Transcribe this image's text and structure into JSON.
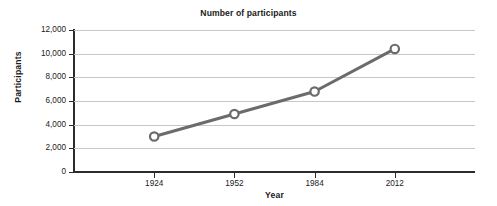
{
  "chart_data": {
    "type": "line",
    "title": "Number of participants",
    "xlabel": "Year",
    "ylabel": "Participants",
    "categories": [
      "1924",
      "1952",
      "1984",
      "2012"
    ],
    "values": [
      3000,
      4900,
      6800,
      10400
    ],
    "series": [
      {
        "name": "Participants",
        "values": [
          3000,
          4900,
          6800,
          10400
        ]
      }
    ],
    "ylim": [
      0,
      12000
    ],
    "ytick_labels": [
      "0",
      "2,000",
      "4,000",
      "6,000",
      "8,000",
      "10,000",
      "12,000"
    ],
    "ytick_values": [
      0,
      2000,
      4000,
      6000,
      8000,
      10000,
      12000
    ],
    "grid": true,
    "legend": false,
    "colors": {
      "line": "#6b6b6b",
      "marker_fill": "#ffffff",
      "marker_stroke": "#6b6b6b",
      "gridline": "#c8c8c8",
      "axis": "#2b2b2b",
      "text": "#1a1a1a",
      "background": "#ffffff"
    }
  }
}
